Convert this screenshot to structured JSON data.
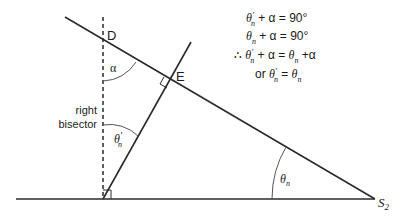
{
  "diagram": {
    "points": {
      "D": "D",
      "E": "E",
      "S2_main": "S",
      "S2_sub": "2"
    },
    "labels": {
      "bisector_line1": "right",
      "bisector_line2": "bisector",
      "alpha": "α",
      "theta_prime": "θ",
      "theta_prime_sub": "n",
      "theta_prime_mark": "′",
      "theta": "θ",
      "theta_sub": "n"
    },
    "equations": [
      {
        "prefix": "",
        "lhs_sym": "θ",
        "lhs_sub": "n",
        "lhs_prime": "′",
        "rest": " + α = 90°"
      },
      {
        "prefix": "",
        "lhs_sym": "θ",
        "lhs_sub": "n",
        "lhs_prime": "",
        "rest": " + α = 90°"
      },
      {
        "prefix": "∴ ",
        "lhs_sym": "θ",
        "lhs_sub": "n",
        "lhs_prime": "′",
        "rest": " + α = ",
        "rhs_sym": "θ",
        "rhs_sub": "n",
        "rhs_rest": " +α"
      },
      {
        "prefix": "or ",
        "lhs_sym": "θ",
        "lhs_sub": "n",
        "lhs_prime": "′",
        "rest": " = ",
        "rhs_sym": "θ",
        "rhs_sub": "n",
        "rhs_rest": ""
      }
    ]
  }
}
